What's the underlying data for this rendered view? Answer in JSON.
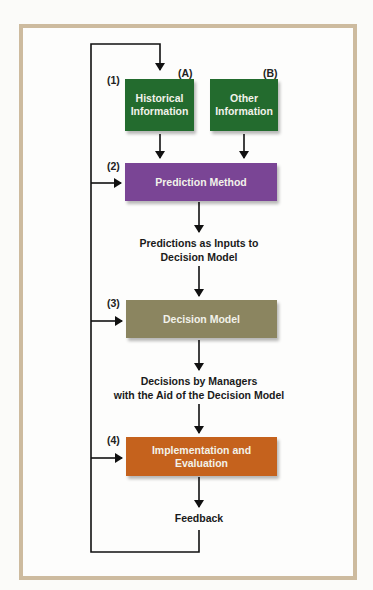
{
  "diagram": {
    "steps": [
      {
        "number": "(1)",
        "boxes": [
          {
            "tag": "(A)",
            "label": "Historical Information",
            "lines": [
              "Historical",
              "Information"
            ],
            "color": "#236b2e"
          },
          {
            "tag": "(B)",
            "label": "Other Information",
            "lines": [
              "Other",
              "Information"
            ],
            "color": "#236b2e"
          }
        ]
      },
      {
        "number": "(2)",
        "label": "Prediction Method",
        "color": "#7a4595"
      },
      {
        "number": "(3)",
        "label": "Decision Model",
        "color": "#8b8560"
      },
      {
        "number": "(4)",
        "label": "Implementation and Evaluation",
        "lines": [
          "Implementation and",
          "Evaluation"
        ],
        "color": "#c5621d"
      }
    ],
    "connectors": {
      "predictions": [
        "Predictions as Inputs to",
        "Decision Model"
      ],
      "decisions": [
        "Decisions by Managers",
        "with the Aid of the Decision Model"
      ],
      "feedback": "Feedback"
    },
    "frame_color": "#cdbb9f"
  }
}
